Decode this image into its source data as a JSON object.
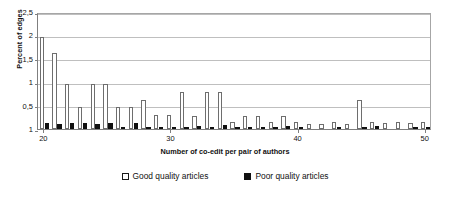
{
  "chart_data": {
    "type": "bar",
    "title": "",
    "xlabel": "Number of co-edit per pair of authors",
    "ylabel": "Percent of edges",
    "xlim": [
      19.5,
      50.5
    ],
    "ylim": [
      0,
      2.5
    ],
    "grid": true,
    "legend_position": "bottom",
    "decimal_separator": ",",
    "x_tick_labels": [
      "20",
      "30",
      "40",
      "50"
    ],
    "x_tick_values": [
      20,
      30,
      40,
      50
    ],
    "y_tick_labels": [
      "1",
      "0,5",
      "1",
      "1,5",
      "2",
      "2,5"
    ],
    "y_tick_values": [
      0,
      0.5,
      1,
      1.5,
      2,
      2.5
    ],
    "categories": [
      20,
      21,
      22,
      23,
      24,
      25,
      26,
      27,
      28,
      29,
      30,
      31,
      32,
      33,
      34,
      35,
      36,
      37,
      38,
      39,
      40,
      41,
      42,
      43,
      44,
      45,
      46,
      47,
      48,
      49,
      50
    ],
    "series": [
      {
        "name": "Good quality articles",
        "color": "#ffffff",
        "edge_color": "#6e6e6e",
        "values": [
          1.97,
          1.63,
          0.97,
          0.48,
          0.97,
          0.97,
          0.48,
          0.47,
          0.63,
          0.29,
          0.29,
          0.79,
          0.28,
          0.79,
          0.79,
          0.16,
          0.28,
          0.28,
          0.16,
          0.28,
          0.16,
          0.1,
          0.1,
          0.14,
          0.1,
          0.62,
          0.14,
          0.12,
          0.16,
          0.12,
          0.14
        ]
      },
      {
        "name": "Poor quality articles",
        "color": "#101010",
        "edge_color": "#101010",
        "values": [
          0.12,
          0.11,
          0.13,
          0.12,
          0.11,
          0.13,
          0.02,
          0.12,
          0.02,
          0.02,
          0.02,
          0.02,
          0.07,
          0.02,
          0.08,
          0.02,
          0.05,
          0.02,
          0.02,
          0.07,
          0.02,
          0.0,
          0.0,
          0.02,
          0.0,
          0.02,
          0.06,
          0.0,
          0.0,
          0.05,
          0.02
        ]
      }
    ]
  },
  "legend": {
    "items": [
      {
        "label": "Good quality articles",
        "swatch": "good-quality-swatch"
      },
      {
        "label": "Poor quality articles",
        "swatch": "poor-quality-swatch"
      }
    ]
  }
}
